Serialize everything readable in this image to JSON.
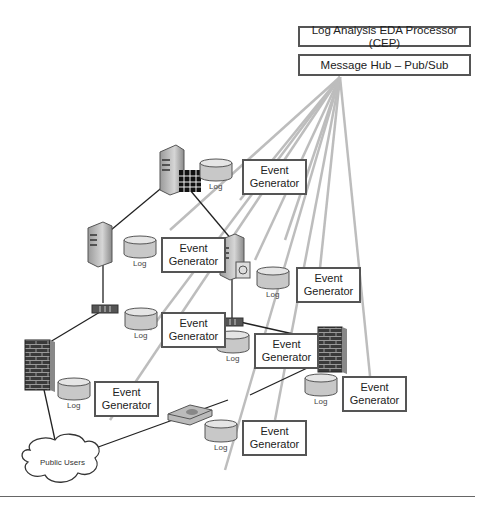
{
  "header": {
    "processor_label": "Log Analysis EDA Processor (CEP)",
    "hub_label": "Message Hub – Pub/Sub"
  },
  "nodes": {
    "event_generator_label_line1": "Event",
    "event_generator_label_line2": "Generator",
    "log_label": "Log",
    "cloud_label": "Public Users"
  },
  "event_generators": [
    {
      "id": "eg-top-server",
      "x": 219,
      "y": 159
    },
    {
      "id": "eg-left-server",
      "x": 157,
      "y": 238
    },
    {
      "id": "eg-right-server",
      "x": 295,
      "y": 268
    },
    {
      "id": "eg-left-router",
      "x": 157,
      "y": 313
    },
    {
      "id": "eg-center",
      "x": 254,
      "y": 333
    },
    {
      "id": "eg-left-firewall",
      "x": 94,
      "y": 380
    },
    {
      "id": "eg-right-firewall",
      "x": 342,
      "y": 376
    },
    {
      "id": "eg-switch",
      "x": 242,
      "y": 420
    }
  ],
  "colors": {
    "connection_line": "#222222",
    "pubsub_line": "#bdbdbd",
    "box_border": "#555555",
    "log_fill": "#c8c8c8"
  }
}
